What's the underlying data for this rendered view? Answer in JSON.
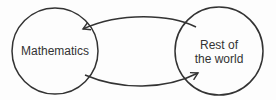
{
  "diagram": {
    "nodes": [
      {
        "id": "mathematics",
        "label": "Mathematics"
      },
      {
        "id": "rest-of-world",
        "label_line1": "Rest of",
        "label_line2": "the world"
      }
    ],
    "edges": [
      {
        "from": "rest-of-world",
        "to": "mathematics"
      },
      {
        "from": "mathematics",
        "to": "rest-of-world"
      }
    ],
    "colors": {
      "stroke": "#333333",
      "text": "#333333",
      "background": "#fdfdfd"
    }
  }
}
